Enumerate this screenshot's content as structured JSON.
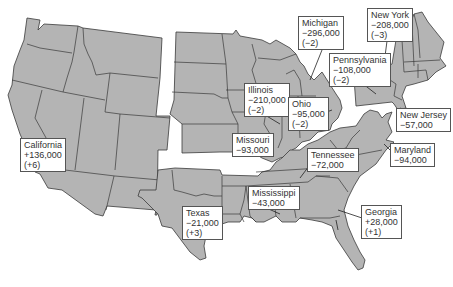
{
  "map": {
    "title": "",
    "fill_color": "#b4b4b4",
    "border_color": "#3a3a3a",
    "regions": [
      "West",
      "Midwest",
      "Northeast",
      "South"
    ]
  },
  "callouts": [
    {
      "state": "California",
      "change": "+136,000",
      "seats": "(+6)"
    },
    {
      "state": "Michigan",
      "change": "−296,000",
      "seats": "(−2)"
    },
    {
      "state": "New York",
      "change": "−208,000",
      "seats": "(−3)"
    },
    {
      "state": "Pennsylvania",
      "change": "−108,000",
      "seats": "(−2)"
    },
    {
      "state": "Illinois",
      "change": "−210,000",
      "seats": "(−2)"
    },
    {
      "state": "Ohio",
      "change": "−95,000",
      "seats": "(−2)"
    },
    {
      "state": "New Jersey",
      "change": "−57,000",
      "seats": ""
    },
    {
      "state": "Missouri",
      "change": "−93,000",
      "seats": ""
    },
    {
      "state": "Tennessee",
      "change": "−72,000",
      "seats": ""
    },
    {
      "state": "Maryland",
      "change": "−94,000",
      "seats": ""
    },
    {
      "state": "Mississippi",
      "change": "−43,000",
      "seats": ""
    },
    {
      "state": "Texas",
      "change": "−21,000",
      "seats": "(+3)"
    },
    {
      "state": "Georgia",
      "change": "+28,000",
      "seats": "(+1)"
    }
  ]
}
